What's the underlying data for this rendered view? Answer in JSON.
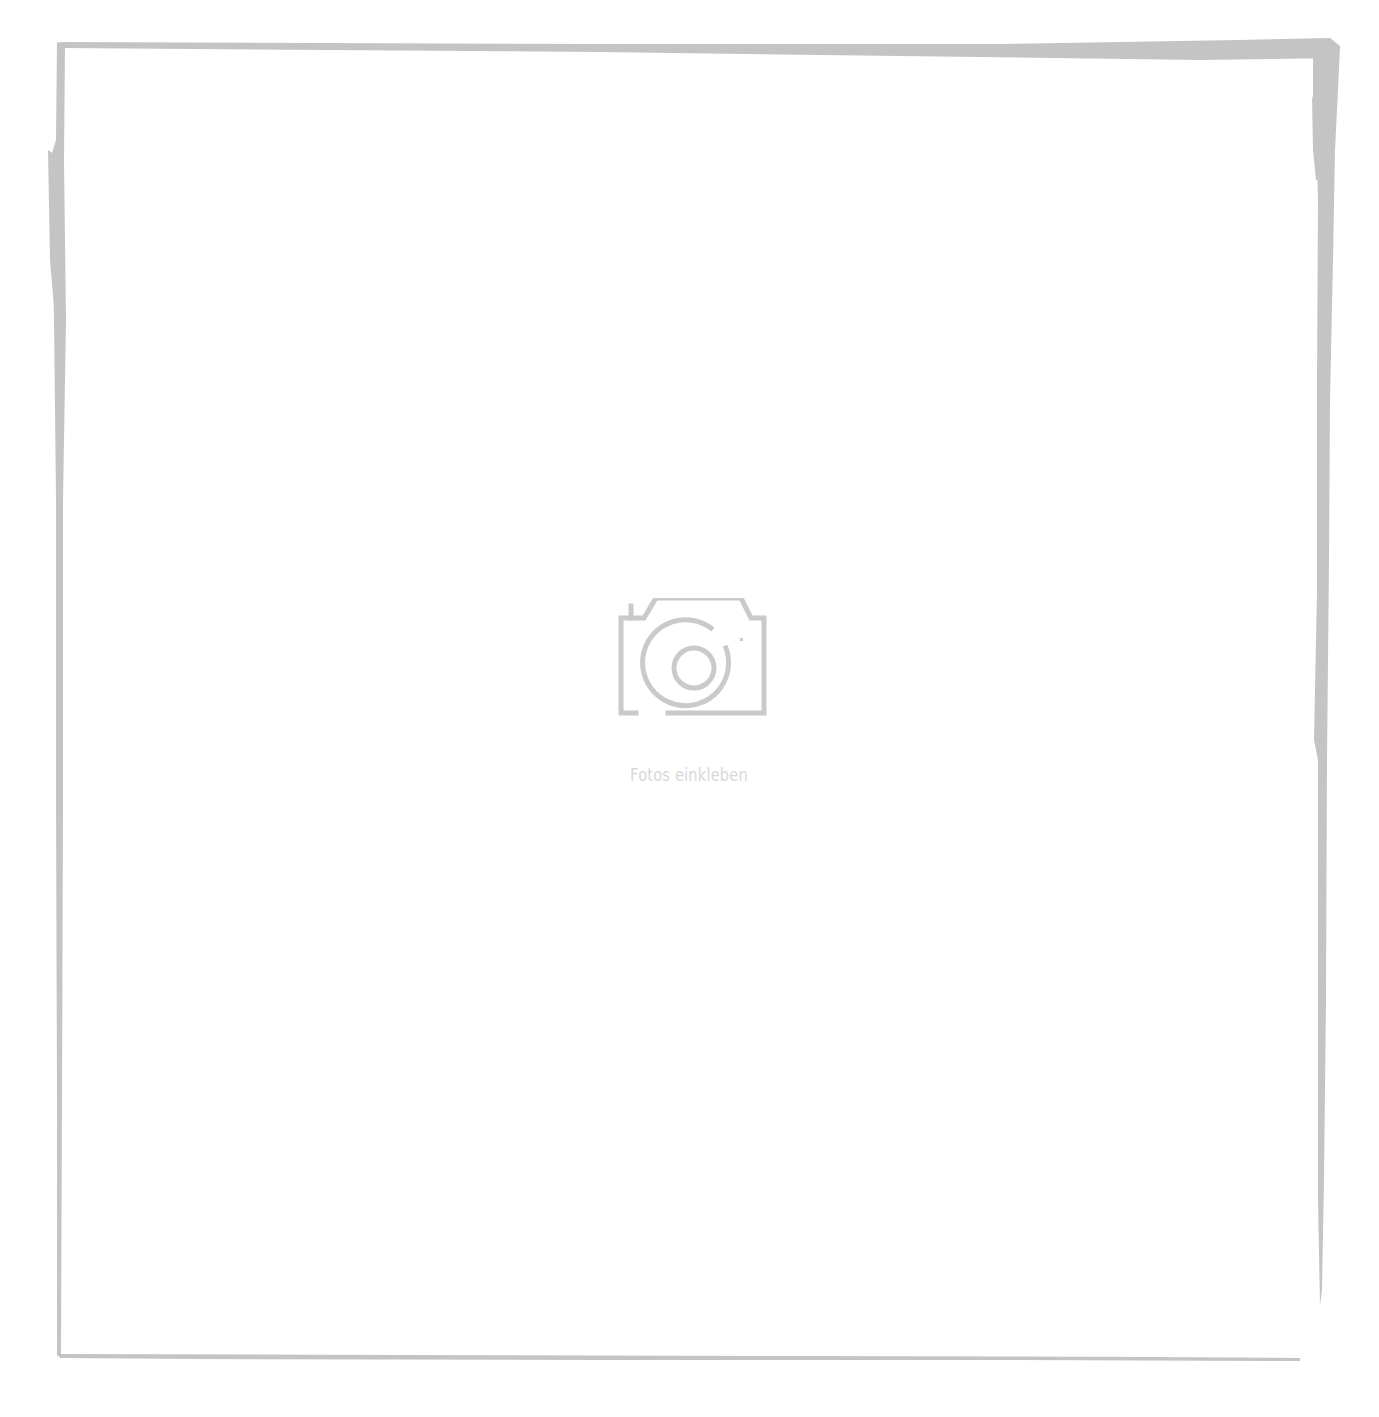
{
  "photo_slot": {
    "placeholder_icon": "camera-icon",
    "placeholder_label": "Fotos einkleben"
  },
  "colors": {
    "background": "#ffffff",
    "frame_stroke": "#c4c4c4",
    "icon_stroke": "#cacaca",
    "label_text": "#d8d8d8"
  }
}
